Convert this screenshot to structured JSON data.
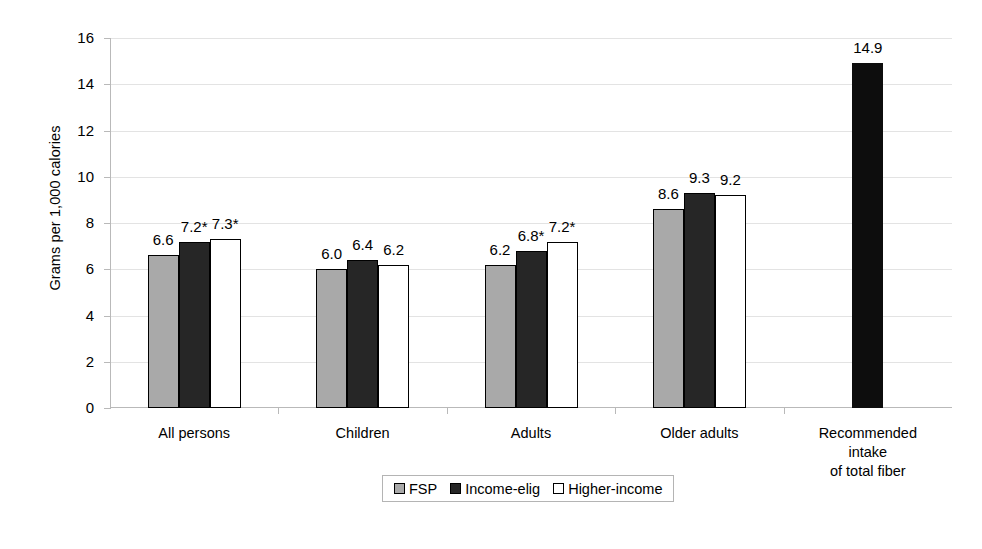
{
  "chart_data": {
    "type": "bar",
    "title": "",
    "xlabel": "",
    "ylabel": "Grams per 1,000 calories",
    "ylim": [
      0,
      16
    ],
    "yticks": [
      0,
      2,
      4,
      6,
      8,
      10,
      12,
      14,
      16
    ],
    "ytick_labels": [
      "0",
      "2",
      "4",
      "6",
      "8",
      "10",
      "12",
      "14",
      "16"
    ],
    "grid": true,
    "legend_position": "bottom",
    "categories": [
      "All persons",
      "Children",
      "Adults",
      "Older adults",
      "Recommended intake\nof total fiber"
    ],
    "series": [
      {
        "name": "FSP",
        "color": "#a9a9a9",
        "values": [
          6.6,
          6.0,
          6.2,
          8.6,
          null
        ],
        "labels": [
          "6.6",
          "6.0",
          "6.2",
          "8.6",
          ""
        ]
      },
      {
        "name": "Income-elig",
        "color": "#262626",
        "values": [
          7.2,
          6.4,
          6.8,
          9.3,
          null
        ],
        "labels": [
          "7.2*",
          "6.4",
          "6.8*",
          "9.3",
          ""
        ]
      },
      {
        "name": "Higher-income",
        "color": "#ffffff",
        "values": [
          7.3,
          6.2,
          7.2,
          9.2,
          null
        ],
        "labels": [
          "7.3*",
          "6.2",
          "7.2*",
          "9.2",
          ""
        ]
      },
      {
        "name": "Recommended intake of total fiber",
        "color": "#0d0d0d",
        "values": [
          null,
          null,
          null,
          null,
          14.9
        ],
        "labels": [
          "",
          "",
          "",
          "",
          "14.9"
        ]
      }
    ],
    "annotations": [
      "* denotes statistically significant difference"
    ]
  },
  "legend": {
    "items": [
      {
        "label": "FSP",
        "swatch": "fsp"
      },
      {
        "label": "Income-elig",
        "swatch": "elig"
      },
      {
        "label": "Higher-income",
        "swatch": "high"
      }
    ]
  },
  "axis": {
    "y_title": "Grams per 1,000 calories"
  },
  "caption": {
    "remnant": ""
  }
}
